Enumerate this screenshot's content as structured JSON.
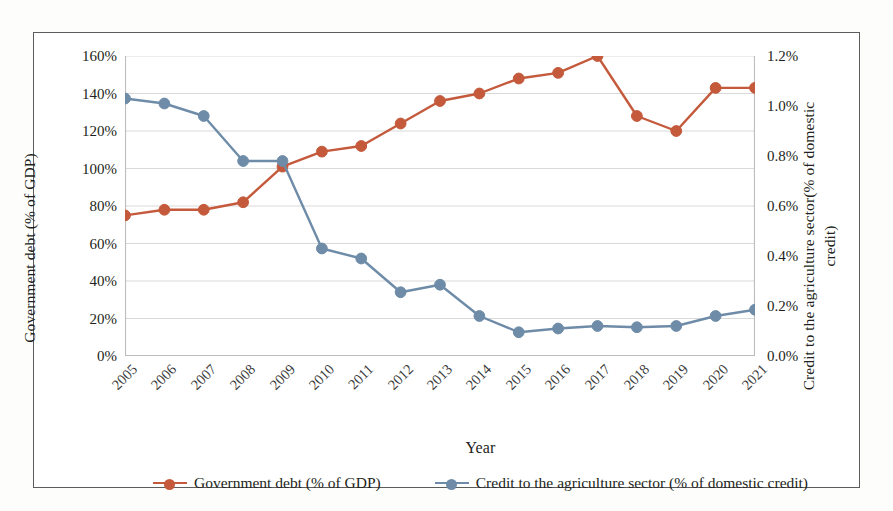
{
  "chart_data": {
    "type": "line",
    "title": "",
    "xlabel": "Year",
    "categories": [
      "2005",
      "2006",
      "2007",
      "2008",
      "2009",
      "2010",
      "2011",
      "2012",
      "2013",
      "2014",
      "2015",
      "2016",
      "2017",
      "2018",
      "2019",
      "2020",
      "2021"
    ],
    "grid": false,
    "legend_position": "bottom",
    "axes": {
      "left": {
        "label": "Government debt (% of GDP)",
        "ylim": [
          0,
          160
        ],
        "ticks": [
          "0%",
          "20%",
          "40%",
          "60%",
          "80%",
          "100%",
          "120%",
          "140%",
          "160%"
        ],
        "tick_values": [
          0,
          20,
          40,
          60,
          80,
          100,
          120,
          140,
          160
        ]
      },
      "right": {
        "label": "Credit to the agriculture sector(% of domestic credit)",
        "ylim": [
          0,
          1.2
        ],
        "ticks": [
          "0.0%",
          "0.2%",
          "0.4%",
          "0.6%",
          "0.8%",
          "1.0%",
          "1.2%"
        ],
        "tick_values": [
          0,
          0.2,
          0.4,
          0.6,
          0.8,
          1.0,
          1.2
        ]
      }
    },
    "series": [
      {
        "name": "Government debt (% of GDP)",
        "axis": "left",
        "color": "#C4593B",
        "values": [
          75,
          78,
          78,
          82,
          101,
          109,
          112,
          124,
          136,
          140,
          148,
          151,
          160,
          128,
          120,
          143,
          143
        ]
      },
      {
        "name": "Credit to the agriculture sector (% of domestic credit)",
        "axis": "right",
        "color": "#6E8CA8",
        "values": [
          1.03,
          1.01,
          0.96,
          0.78,
          0.78,
          0.43,
          0.39,
          0.255,
          0.285,
          0.16,
          0.095,
          0.11,
          0.12,
          0.115,
          0.12,
          0.16,
          0.185
        ]
      }
    ]
  },
  "legend": {
    "items": [
      {
        "label": "Government debt (% of GDP)",
        "color": "#C4593B"
      },
      {
        "label": "Credit to the agriculture sector (% of domestic credit)",
        "color": "#6E8CA8"
      }
    ]
  }
}
